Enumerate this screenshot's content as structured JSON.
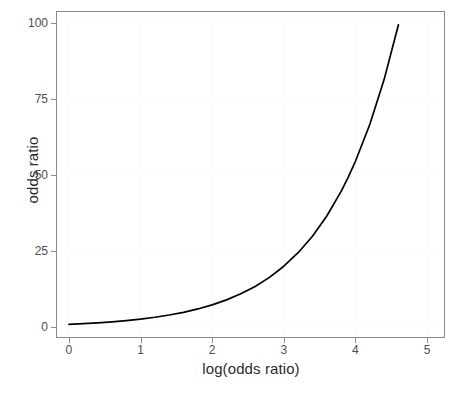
{
  "chart_data": {
    "type": "line",
    "title": "",
    "xlabel": "log(odds ratio)",
    "ylabel": "odds ratio",
    "xlim": [
      -0.18,
      5.25
    ],
    "ylim": [
      -3.5,
      104
    ],
    "xticks": [
      "0",
      "1",
      "2",
      "3",
      "4",
      "5"
    ],
    "xtick_values": [
      0,
      1,
      2,
      3,
      4,
      5
    ],
    "yticks": [
      "0",
      "25",
      "50",
      "75",
      "100"
    ],
    "ytick_values": [
      0,
      25,
      50,
      75,
      100
    ],
    "grid": "faint",
    "legend": "none",
    "series": [
      {
        "name": "odds ratio = exp(log odds ratio)",
        "color": "#000000",
        "x": [
          0.0,
          0.2,
          0.4,
          0.6,
          0.8,
          1.0,
          1.2,
          1.4,
          1.6,
          1.8,
          2.0,
          2.2,
          2.4,
          2.6,
          2.8,
          3.0,
          3.2,
          3.4,
          3.6,
          3.8,
          3.9,
          4.0,
          4.2,
          4.4,
          4.6
        ],
        "values": [
          1.0,
          1.22,
          1.49,
          1.82,
          2.23,
          2.72,
          3.32,
          4.06,
          4.95,
          6.05,
          7.39,
          9.03,
          11.02,
          13.46,
          16.44,
          20.09,
          24.53,
          29.96,
          36.6,
          44.7,
          49.4,
          54.6,
          66.69,
          81.45,
          99.48
        ]
      }
    ]
  },
  "axis": {
    "x_title": "log(odds ratio)",
    "y_title": "odds ratio",
    "x_tick_labels": [
      "0",
      "1",
      "2",
      "3",
      "4",
      "5"
    ],
    "y_tick_labels": [
      "0",
      "25",
      "50",
      "75",
      "100"
    ]
  },
  "colors": {
    "curve": "#000000",
    "panel_border": "#8a8a8a",
    "tick_mark": "#8a8a8a",
    "grid": "#fafafa",
    "background": "#ffffff",
    "tick_text": "#4d4d4d",
    "title_text": "#2b2b2b"
  },
  "caption": {
    "text": ""
  }
}
